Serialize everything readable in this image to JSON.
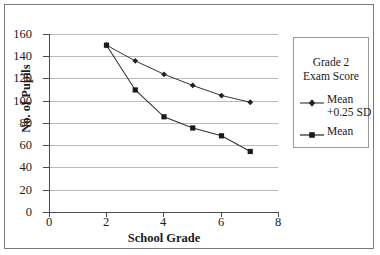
{
  "chart_data": {
    "type": "line",
    "title": "",
    "xlabel": "School Grade",
    "ylabel": "No. of Pupils",
    "xlim": [
      0,
      8
    ],
    "ylim": [
      0,
      160
    ],
    "xticks": [
      "0",
      "2",
      "4",
      "6",
      "8"
    ],
    "yticks": [
      "0",
      "20",
      "40",
      "60",
      "80",
      "100",
      "120",
      "140",
      "160"
    ],
    "grid": "horizontal",
    "legend_position": "right",
    "legend_title": "Grade 2 Exam Score",
    "x": [
      2,
      3,
      4,
      5,
      6,
      7
    ],
    "series": [
      {
        "name": "Mean +0.25 SD",
        "marker": "diamond",
        "values": [
          150,
          136,
          124,
          114,
          105,
          99
        ]
      },
      {
        "name": "Mean",
        "marker": "square",
        "values": [
          150,
          110,
          86,
          76,
          69,
          55
        ]
      }
    ]
  },
  "legend": {
    "title_line1": "Grade 2",
    "title_line2": "Exam Score",
    "entries": [
      {
        "label_line1": "Mean",
        "label_line2": "+0.25 SD",
        "marker": "diamond"
      },
      {
        "label_line1": "Mean",
        "label_line2": "",
        "marker": "square"
      }
    ]
  },
  "axes": {
    "y_title": "No. of Pupils",
    "x_title": "School Grade",
    "y_labels": [
      "160",
      "140",
      "120",
      "100",
      "80",
      "60",
      "40",
      "20",
      "0"
    ],
    "x_labels": [
      "0",
      "2",
      "4",
      "6",
      "8"
    ]
  },
  "colors": {
    "series_line": "#333333",
    "gridline": "#b9b9b9",
    "axis": "#4a4a4a",
    "frame": "#7a7a7a",
    "background": "#ffffff"
  }
}
